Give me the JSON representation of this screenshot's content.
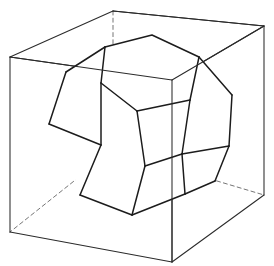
{
  "figure": {
    "kind": "geometric-line-drawing",
    "background_color": "#ffffff",
    "canvas": {
      "width": 274,
      "height": 266
    },
    "stroke_colors": {
      "cube_visible": "#2b2b2b",
      "cube_hidden": "#6e6e6e",
      "solid_visible": "#1c1c1c",
      "solid_hidden": "#7a7a7a"
    },
    "labels": [],
    "annotations": []
  },
  "cube": {
    "name": "circumscribed-cube",
    "vertex_count": 8,
    "visible_edge_count": 9,
    "hidden_edge_count": 3,
    "vertices": {
      "top_back": [
        113,
        11
      ],
      "top_left": [
        10,
        57
      ],
      "top_right": [
        264,
        26
      ],
      "top_front": [
        172,
        80
      ],
      "bottom_back": [
        113,
        150
      ],
      "bottom_left": [
        10,
        232
      ],
      "bottom_right": [
        264,
        195
      ],
      "bottom_front": [
        172,
        262
      ]
    },
    "visible_edges": [
      [
        "top_back",
        "top_left"
      ],
      [
        "top_back",
        "top_right"
      ],
      [
        "top_left",
        "top_front"
      ],
      [
        "top_right",
        "top_front"
      ],
      [
        "top_left",
        "bottom_left"
      ],
      [
        "top_right",
        "bottom_right"
      ],
      [
        "top_front",
        "bottom_front"
      ],
      [
        "bottom_left",
        "bottom_front"
      ],
      [
        "bottom_front",
        "bottom_right"
      ]
    ],
    "hidden_edges": [
      [
        "top_back",
        "bottom_back"
      ],
      [
        "bottom_back",
        "bottom_left"
      ],
      [
        "bottom_back",
        "bottom_right"
      ]
    ]
  },
  "dodecahedron": {
    "name": "inscribed-regular-dodecahedron",
    "face_count": 12,
    "vertex_count": 20,
    "visible_face_count": 6,
    "vertices": {
      "v1": [
        105,
        47
      ],
      "v2": [
        152,
        35
      ],
      "v3": [
        199,
        57
      ],
      "v4": [
        192,
        104
      ],
      "v5": [
        143,
        117
      ],
      "v6": [
        96,
        95
      ],
      "v7": [
        66,
        72
      ],
      "v8": [
        49,
        124
      ],
      "v9": [
        103,
        145
      ],
      "v10": [
        80,
        195
      ],
      "v11": [
        132,
        215
      ],
      "v12": [
        185,
        194
      ],
      "v13": [
        229,
        146
      ],
      "v14": [
        232,
        95
      ],
      "v15": [
        172,
        151
      ],
      "v16": [
        215,
        181
      ],
      "v17": [
        127,
        86
      ],
      "v18": [
        160,
        72
      ],
      "v19": [
        88,
        160
      ],
      "v20": [
        148,
        183
      ]
    },
    "visible_faces": [
      {
        "id": "face-top",
        "label": "top pentagon",
        "points": "105,47 152,35 199,57 192,104 143,117 96,95 127,86"
      },
      {
        "id": "face-upper-front",
        "label": "upper front pentagon",
        "points": "96,95 143,117 192,104 185,152 132,163 90,133"
      }
    ],
    "edges_visible": [
      [
        "v1",
        "v2"
      ],
      [
        "v2",
        "v3"
      ],
      [
        "v3",
        "v4"
      ],
      [
        "v4",
        "v5"
      ],
      [
        "v5",
        "v6"
      ],
      [
        "v6",
        "v1"
      ],
      [
        "v6",
        "v7"
      ],
      [
        "v7",
        "v8"
      ],
      [
        "v8",
        "v9"
      ],
      [
        "v9",
        "v5"
      ],
      [
        "v9",
        "v10"
      ],
      [
        "v10",
        "v11"
      ],
      [
        "v11",
        "v12"
      ],
      [
        "v12",
        "v15"
      ],
      [
        "v15",
        "v9"
      ],
      [
        "v4",
        "v14"
      ],
      [
        "v14",
        "v13"
      ],
      [
        "v13",
        "v16"
      ],
      [
        "v16",
        "v12"
      ],
      [
        "v12",
        "v15"
      ],
      [
        "v1",
        "v7"
      ],
      [
        "v3",
        "v14"
      ]
    ]
  }
}
